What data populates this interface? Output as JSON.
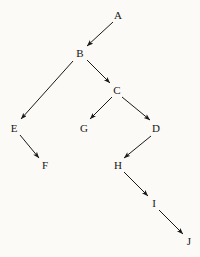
{
  "diagram": {
    "type": "directed-graph",
    "background_color": "#fbfaf6",
    "node_text_color": "#161616",
    "edge_color": "#1a1a1a",
    "edge_width": 1,
    "arrowhead_style": "solid-filled-triangle",
    "canvas": {
      "width": 200,
      "height": 257
    },
    "nodes": [
      {
        "id": "A",
        "label": "A",
        "x": 118,
        "y": 15
      },
      {
        "id": "B",
        "label": "B",
        "x": 80,
        "y": 53
      },
      {
        "id": "C",
        "label": "C",
        "x": 117,
        "y": 90
      },
      {
        "id": "D",
        "label": "D",
        "x": 156,
        "y": 128
      },
      {
        "id": "E",
        "label": "E",
        "x": 14,
        "y": 128
      },
      {
        "id": "F",
        "label": "F",
        "x": 45,
        "y": 165
      },
      {
        "id": "G",
        "label": "G",
        "x": 84,
        "y": 128
      },
      {
        "id": "H",
        "label": "H",
        "x": 118,
        "y": 165
      },
      {
        "id": "I",
        "label": "I",
        "x": 154,
        "y": 203
      },
      {
        "id": "J",
        "label": "J",
        "x": 189,
        "y": 241
      }
    ],
    "edges": [
      {
        "from": "A",
        "to": "B",
        "x1": 113,
        "y1": 22,
        "x2": 87,
        "y2": 46
      },
      {
        "from": "B",
        "to": "E",
        "x1": 73,
        "y1": 61,
        "x2": 21,
        "y2": 119
      },
      {
        "from": "B",
        "to": "C",
        "x1": 87,
        "y1": 60,
        "x2": 110,
        "y2": 83
      },
      {
        "from": "C",
        "to": "G",
        "x1": 112,
        "y1": 97,
        "x2": 90,
        "y2": 119
      },
      {
        "from": "C",
        "to": "D",
        "x1": 122,
        "y1": 97,
        "x2": 150,
        "y2": 120
      },
      {
        "from": "E",
        "to": "F",
        "x1": 20,
        "y1": 135,
        "x2": 39,
        "y2": 158
      },
      {
        "from": "D",
        "to": "H",
        "x1": 151,
        "y1": 136,
        "x2": 124,
        "y2": 158
      },
      {
        "from": "H",
        "to": "I",
        "x1": 124,
        "y1": 172,
        "x2": 148,
        "y2": 196
      },
      {
        "from": "I",
        "to": "J",
        "x1": 159,
        "y1": 210,
        "x2": 183,
        "y2": 234
      }
    ]
  }
}
